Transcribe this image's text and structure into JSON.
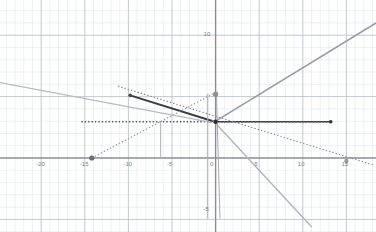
{
  "chart_data": {
    "type": "line",
    "title": "",
    "xlabel": "",
    "ylabel": "",
    "xlim": [
      -26.5,
      18.5
    ],
    "ylim": [
      -6.0,
      12.6
    ],
    "grid": true,
    "grid_minor_step": 1,
    "grid_major_step": 5,
    "legend": "none",
    "axis_color": "#8b8b95",
    "grid_minor_color": "#dfe7ef",
    "grid_major_color": "#b9c3ce",
    "xticks": [
      -25,
      -20,
      -15,
      -10,
      -5,
      0,
      5,
      10,
      15
    ],
    "xtick_labels": [
      "5",
      "-20",
      "-15",
      "-10",
      "-5",
      "0",
      "5",
      "10",
      "15"
    ],
    "yticks": [
      10,
      0,
      -5
    ],
    "ytick_labels": [
      "10",
      "0",
      "-5"
    ],
    "series": [
      {
        "name": "gray-rising-ray",
        "style": "solid",
        "color": "#9b9ba6",
        "width": 1.6,
        "points": [
          [
            0.0,
            3.0
          ],
          [
            18.4,
            11.0
          ]
        ]
      },
      {
        "name": "dark-segment-upper-left",
        "style": "solid",
        "color": "#3b3b44",
        "width": 2.0,
        "points": [
          [
            -9.8,
            5.1
          ],
          [
            -0.1,
            2.95
          ]
        ]
      },
      {
        "name": "dark-segment-right",
        "style": "solid",
        "color": "#3b3b44",
        "width": 1.6,
        "points": [
          [
            -0.1,
            2.95
          ],
          [
            13.2,
            2.95
          ]
        ]
      },
      {
        "name": "horizontal-dotted-line",
        "style": "dotted",
        "color": "#54545e",
        "width": 1.4,
        "points": [
          [
            -15.4,
            2.95
          ],
          [
            13.0,
            2.95
          ]
        ]
      },
      {
        "name": "dotted-rising-from-left-point",
        "style": "dotted",
        "color": "#9a9aa4",
        "width": 1.2,
        "points": [
          [
            -14.2,
            0.0
          ],
          [
            -0.2,
            5.25
          ]
        ]
      },
      {
        "name": "dotted-descending-long",
        "style": "dotted",
        "color": "#8d8d98",
        "width": 1.2,
        "points": [
          [
            -11.2,
            5.85
          ],
          [
            18.0,
            -0.55
          ]
        ]
      },
      {
        "name": "gray-descending-ray",
        "style": "solid",
        "color": "#b4b4bd",
        "width": 1.4,
        "points": [
          [
            -0.3,
            3.05
          ],
          [
            11.0,
            -5.6
          ]
        ]
      },
      {
        "name": "gray-line-lower-left",
        "style": "solid",
        "color": "#b9b9c2",
        "width": 1.2,
        "points": [
          [
            -25.2,
            6.2
          ],
          [
            -0.5,
            2.9
          ]
        ]
      },
      {
        "name": "vertical-drop-left",
        "style": "solid",
        "color": "#a8a8b2",
        "width": 1.0,
        "points": [
          [
            -0.9,
            5.2
          ],
          [
            -0.9,
            -4.9
          ]
        ]
      },
      {
        "name": "vertical-drop-right",
        "style": "solid",
        "color": "#a8a8b2",
        "width": 1.0,
        "points": [
          [
            0.1,
            5.2
          ],
          [
            0.5,
            -4.9
          ]
        ]
      },
      {
        "name": "vertical-tick-mid",
        "style": "solid",
        "color": "#b0b0ba",
        "width": 1.0,
        "points": [
          [
            -6.3,
            2.95
          ],
          [
            -6.3,
            0.0
          ]
        ]
      }
    ],
    "points": [
      {
        "name": "vertex-origin-upper",
        "x": 0.0,
        "y": 5.2,
        "color": "#8f8f9a",
        "r": 2.6
      },
      {
        "name": "vertex-origin",
        "x": 0.0,
        "y": 2.95,
        "color": "#2f2f38",
        "r": 2.2
      },
      {
        "name": "endpoint-right",
        "x": 13.2,
        "y": 2.95,
        "color": "#2f2f38",
        "r": 1.8
      },
      {
        "name": "endpoint-upper-left",
        "x": -9.8,
        "y": 5.1,
        "color": "#45454f",
        "r": 1.8
      },
      {
        "name": "point-on-xaxis-left",
        "x": -14.2,
        "y": 0.0,
        "color": "#6d6d78",
        "r": 2.6
      },
      {
        "name": "point-on-xaxis-right",
        "x": 15.0,
        "y": -0.25,
        "color": "#9a9aa4",
        "r": 2.2
      }
    ]
  }
}
